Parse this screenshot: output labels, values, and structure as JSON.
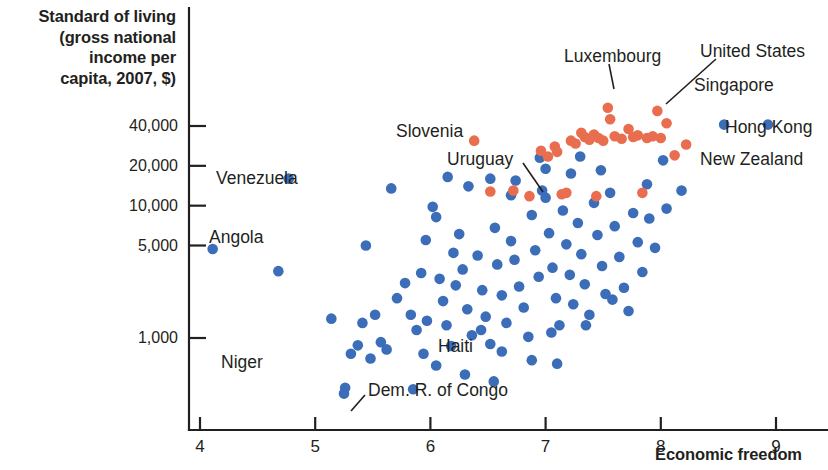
{
  "chart_data": {
    "type": "scatter",
    "title": "",
    "ylabel": "Standard of living\n(gross national\nincome per\ncapita, 2007, $)",
    "ylabel_lines": [
      "Standard of living",
      "(gross national",
      "income per",
      "capita, 2007, $)"
    ],
    "xlabel": "Economic freedom",
    "yscale": "log",
    "ylim": [
      300,
      60000
    ],
    "xlim": [
      3.85,
      9.05
    ],
    "grid": false,
    "legend": null,
    "yticks": [
      1000,
      5000,
      10000,
      20000,
      40000
    ],
    "ytick_labels": [
      "1,000",
      "5,000",
      "10,000",
      "20,000",
      "40,000"
    ],
    "xticks": [
      4,
      5,
      6,
      7,
      8,
      9
    ],
    "xtick_labels": [
      "4",
      "5",
      "6",
      "7",
      "8",
      "9"
    ],
    "colors": {
      "blue": "#3b6db8",
      "orange": "#e86e4f",
      "axis": "#231f20",
      "text": "#231f20",
      "background": "#ffffff"
    },
    "series": [
      {
        "name": "lower-freedom countries",
        "color": "#3b6db8",
        "points": [
          [
            4.11,
            4700
          ],
          [
            4.77,
            16000
          ],
          [
            4.68,
            3200
          ],
          [
            5.14,
            1400
          ],
          [
            5.31,
            760
          ],
          [
            5.26,
            420
          ],
          [
            5.25,
            380
          ],
          [
            5.44,
            5000
          ],
          [
            5.41,
            1300
          ],
          [
            5.37,
            880
          ],
          [
            5.48,
            700
          ],
          [
            5.52,
            1500
          ],
          [
            5.57,
            930
          ],
          [
            5.62,
            820
          ],
          [
            5.66,
            13500
          ],
          [
            5.78,
            2600
          ],
          [
            5.71,
            2000
          ],
          [
            5.83,
            1500
          ],
          [
            5.88,
            1150
          ],
          [
            5.94,
            760
          ],
          [
            5.92,
            3100
          ],
          [
            5.97,
            1350
          ],
          [
            6.02,
            9800
          ],
          [
            6.05,
            8200
          ],
          [
            6.08,
            2800
          ],
          [
            6.11,
            1900
          ],
          [
            6.14,
            1250
          ],
          [
            6.18,
            870
          ],
          [
            6.22,
            2500
          ],
          [
            6.25,
            6100
          ],
          [
            6.28,
            3300
          ],
          [
            6.32,
            1650
          ],
          [
            6.36,
            1050
          ],
          [
            6.41,
            4200
          ],
          [
            6.45,
            2300
          ],
          [
            6.33,
            14000
          ],
          [
            6.48,
            1450
          ],
          [
            6.52,
            900
          ],
          [
            6.56,
            6800
          ],
          [
            6.58,
            3600
          ],
          [
            6.62,
            2100
          ],
          [
            6.66,
            1300
          ],
          [
            6.7,
            5400
          ],
          [
            6.73,
            3900
          ],
          [
            6.77,
            2450
          ],
          [
            6.81,
            1700
          ],
          [
            6.85,
            1020
          ],
          [
            6.88,
            8500
          ],
          [
            6.91,
            4600
          ],
          [
            6.94,
            2900
          ],
          [
            6.97,
            13000
          ],
          [
            7.0,
            11500
          ],
          [
            7.03,
            6200
          ],
          [
            7.06,
            3400
          ],
          [
            7.09,
            2000
          ],
          [
            7.12,
            1250
          ],
          [
            7.15,
            9200
          ],
          [
            7.18,
            5100
          ],
          [
            7.21,
            3000
          ],
          [
            7.24,
            1800
          ],
          [
            7.28,
            7400
          ],
          [
            7.31,
            4300
          ],
          [
            7.34,
            2550
          ],
          [
            7.38,
            1500
          ],
          [
            7.42,
            10500
          ],
          [
            7.45,
            6000
          ],
          [
            7.49,
            3500
          ],
          [
            7.52,
            2150
          ],
          [
            7.56,
            12500
          ],
          [
            7.6,
            7000
          ],
          [
            7.64,
            4100
          ],
          [
            7.68,
            2400
          ],
          [
            7.72,
            1600
          ],
          [
            7.76,
            8800
          ],
          [
            7.8,
            5300
          ],
          [
            7.84,
            3150
          ],
          [
            7.88,
            14500
          ],
          [
            7.95,
            4800
          ],
          [
            8.02,
            22000
          ],
          [
            8.18,
            13000
          ],
          [
            8.55,
            41000
          ],
          [
            8.93,
            41000
          ],
          [
            6.15,
            16500
          ],
          [
            6.52,
            16000
          ],
          [
            6.74,
            15500
          ],
          [
            5.96,
            5500
          ],
          [
            6.2,
            4400
          ],
          [
            6.44,
            1150
          ],
          [
            6.62,
            790
          ],
          [
            6.88,
            680
          ],
          [
            7.05,
            1100
          ],
          [
            7.35,
            1250
          ],
          [
            7.58,
            1950
          ],
          [
            6.3,
            530
          ],
          [
            6.55,
            470
          ],
          [
            7.1,
            640
          ],
          [
            5.85,
            410
          ],
          [
            6.05,
            620
          ],
          [
            6.7,
            12000
          ],
          [
            7.0,
            19000
          ],
          [
            7.22,
            17500
          ],
          [
            7.48,
            18500
          ],
          [
            6.95,
            23000
          ],
          [
            7.3,
            23500
          ],
          [
            7.9,
            8000
          ],
          [
            8.05,
            9500
          ]
        ]
      },
      {
        "name": "higher-freedom countries",
        "color": "#e86e4f",
        "points": [
          [
            6.38,
            31000
          ],
          [
            6.52,
            12800
          ],
          [
            6.72,
            13000
          ],
          [
            6.86,
            11800
          ],
          [
            6.96,
            26000
          ],
          [
            7.02,
            23500
          ],
          [
            7.08,
            28000
          ],
          [
            7.1,
            25500
          ],
          [
            7.18,
            12500
          ],
          [
            7.22,
            31000
          ],
          [
            7.26,
            29500
          ],
          [
            7.31,
            35500
          ],
          [
            7.34,
            33000
          ],
          [
            7.38,
            31500
          ],
          [
            7.42,
            34500
          ],
          [
            7.46,
            32500
          ],
          [
            7.5,
            31000
          ],
          [
            7.54,
            55000
          ],
          [
            7.56,
            45000
          ],
          [
            7.6,
            33500
          ],
          [
            7.66,
            32000
          ],
          [
            7.72,
            38000
          ],
          [
            7.76,
            33000
          ],
          [
            7.8,
            34000
          ],
          [
            7.84,
            12500
          ],
          [
            7.88,
            32500
          ],
          [
            7.93,
            33500
          ],
          [
            7.97,
            52000
          ],
          [
            8.0,
            32500
          ],
          [
            8.05,
            42000
          ],
          [
            8.12,
            24000
          ],
          [
            8.22,
            29000
          ],
          [
            7.44,
            11800
          ],
          [
            7.14,
            12200
          ]
        ]
      }
    ],
    "annotations": [
      {
        "id": "venezuela",
        "text": "Venezuela",
        "label_x": 216,
        "label_y": 169,
        "leader": null
      },
      {
        "id": "angola",
        "text": "Angola",
        "label_x": 209,
        "label_y": 228,
        "leader": null
      },
      {
        "id": "niger",
        "text": "Niger",
        "label_x": 221,
        "label_y": 353,
        "leader": null
      },
      {
        "id": "haiti",
        "text": "Haiti",
        "label_x": 438,
        "label_y": 337,
        "leader": null
      },
      {
        "id": "dem-r-of-congo",
        "text": "Dem. R. of Congo",
        "label_x": 368,
        "label_y": 381,
        "leader": [
          365,
          395,
          351,
          411
        ]
      },
      {
        "id": "slovenia",
        "text": "Slovenia",
        "label_x": 396,
        "label_y": 122,
        "leader": null
      },
      {
        "id": "uruguay",
        "text": "Uruguay",
        "label_x": 447,
        "label_y": 150,
        "leader": [
          523,
          163,
          543,
          192
        ]
      },
      {
        "id": "luxembourg",
        "text": "Luxembourg",
        "label_x": 564,
        "label_y": 47,
        "leader": [
          609,
          64,
          614,
          89
        ]
      },
      {
        "id": "united-states",
        "text": "United States",
        "label_x": 700,
        "label_y": 42,
        "leader": [
          716,
          59,
          666,
          104
        ]
      },
      {
        "id": "singapore",
        "text": "Singapore",
        "label_x": 694,
        "label_y": 76,
        "leader": null
      },
      {
        "id": "hong-kong",
        "text": "Hong Kong",
        "label_x": 725,
        "label_y": 118,
        "leader": null
      },
      {
        "id": "new-zealand",
        "text": "New Zealand",
        "label_x": 700,
        "label_y": 150,
        "leader": null
      }
    ]
  }
}
